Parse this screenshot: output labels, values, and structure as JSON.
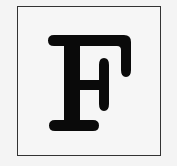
{
  "tile": {
    "letter": "F",
    "border_color": "#333333",
    "background_color": "#f6f6f6",
    "glyph_color": "#0a0a0a"
  }
}
